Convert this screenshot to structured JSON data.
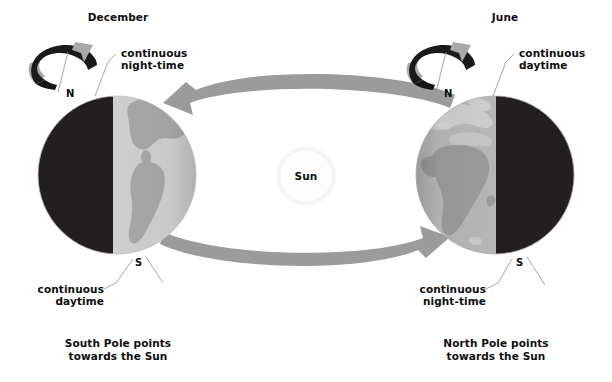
{
  "diagram": {
    "title_alt": "Earth's tilt and seasons: December and June solstices",
    "background_color": "#ffffff",
    "colors": {
      "night_side": "#231f20",
      "ocean_light": "#cfcfcf",
      "land_gray": "#a7a7a7",
      "ocean_mid": "#b3b3b3",
      "land_dark": "#949494",
      "orbit_arrow": "#9b9b9b",
      "spin_ribbon_dark": "#1a1a1a",
      "spin_ribbon_light": "#a8a8a8",
      "sun_fill": "#fdfdfd",
      "leader_line": "#8f8f8f",
      "text": "#0d0d0d"
    }
  },
  "sun": {
    "label": "Sun"
  },
  "left_scene": {
    "season_label": "December",
    "pole_top_letter": "N",
    "pole_bottom_letter": "S",
    "top_callout": "continuous\nnight-time",
    "top_callout_line1": "continuous",
    "top_callout_line2": "night-time",
    "bottom_callout_line1": "continuous",
    "bottom_callout_line2": "daytime",
    "caption_line1": "South Pole points",
    "caption_line2": "towards the Sun",
    "lit_side": "right",
    "dark_side": "left",
    "spin_icon": "rotation-arrow-icon"
  },
  "right_scene": {
    "season_label": "June",
    "pole_top_letter": "N",
    "pole_bottom_letter": "S",
    "top_callout_line1": "continuous",
    "top_callout_line2": "daytime",
    "bottom_callout_line1": "continuous",
    "bottom_callout_line2": "night-time",
    "caption_line1": "North Pole points",
    "caption_line2": "towards the Sun",
    "lit_side": "left",
    "dark_side": "right",
    "spin_icon": "rotation-arrow-icon"
  },
  "orbit": {
    "top_arrow_direction": "right-to-left",
    "bottom_arrow_direction": "left-to-right"
  }
}
